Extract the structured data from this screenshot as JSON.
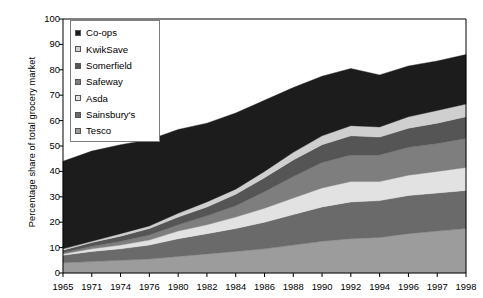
{
  "chart_data": {
    "type": "area",
    "stacked": true,
    "title": "",
    "xlabel": "",
    "ylabel": "Percentage share of total grocery market",
    "ylim": [
      0,
      100
    ],
    "ytick_labels": [
      "0",
      "10",
      "20",
      "30",
      "40",
      "50",
      "60",
      "70",
      "80",
      "90",
      "100"
    ],
    "grid": false,
    "legend_position": "top-left",
    "categories": [
      "1965",
      "1971",
      "1974",
      "1976",
      "1980",
      "1982",
      "1984",
      "1986",
      "1988",
      "1990",
      "1992",
      "1994",
      "1996",
      "1997",
      "1998"
    ],
    "x": [
      1965,
      1971,
      1974,
      1976,
      1980,
      1982,
      1984,
      1986,
      1988,
      1990,
      1992,
      1994,
      1996,
      1997,
      1998
    ],
    "series": [
      {
        "name": "Tesco",
        "color": "#9c9c9c",
        "values": [
          4.0,
          4.5,
          5.0,
          5.5,
          6.5,
          7.5,
          8.5,
          9.5,
          11.0,
          12.5,
          13.5,
          14.0,
          15.5,
          16.5,
          17.5
        ]
      },
      {
        "name": "Sainsbury's",
        "color": "#6a6a6a",
        "values": [
          3.0,
          4.0,
          4.5,
          5.5,
          7.0,
          8.0,
          9.0,
          10.5,
          12.0,
          13.5,
          14.5,
          14.5,
          15.0,
          15.0,
          15.0
        ]
      },
      {
        "name": "Asda",
        "color": "#e2e2e2",
        "values": [
          0.5,
          1.0,
          1.5,
          2.0,
          3.0,
          3.5,
          4.5,
          5.5,
          6.5,
          7.5,
          8.0,
          7.5,
          8.0,
          8.5,
          9.0
        ]
      },
      {
        "name": "Safeway",
        "color": "#7e7e7e",
        "values": [
          0.5,
          1.0,
          1.5,
          2.0,
          2.5,
          3.5,
          4.5,
          6.5,
          8.5,
          10.0,
          10.5,
          10.5,
          11.0,
          11.0,
          11.5
        ]
      },
      {
        "name": "Somerfield",
        "color": "#555555",
        "values": [
          1.0,
          1.5,
          2.0,
          2.5,
          3.0,
          3.5,
          4.5,
          5.5,
          6.5,
          7.0,
          7.5,
          7.0,
          7.5,
          8.0,
          8.5
        ]
      },
      {
        "name": "KwikSave",
        "color": "#cfcfcf",
        "values": [
          0.5,
          0.5,
          1.0,
          1.0,
          1.5,
          2.0,
          2.0,
          2.5,
          3.0,
          3.5,
          4.0,
          4.0,
          4.5,
          5.0,
          5.0
        ]
      },
      {
        "name": "Co-ops",
        "color": "#1c1c1c",
        "values": [
          34.5,
          35.5,
          35.0,
          34.0,
          33.0,
          31.0,
          30.0,
          28.0,
          25.5,
          23.5,
          22.5,
          20.5,
          20.0,
          19.5,
          19.5
        ]
      }
    ],
    "totals": [
      44.0,
      48.0,
      50.5,
      52.5,
      56.5,
      59.0,
      63.0,
      68.0,
      73.0,
      77.5,
      80.5,
      78.0,
      81.5,
      83.5,
      86.0
    ]
  },
  "legend": {
    "items": [
      {
        "label": "Co-ops",
        "color": "#1c1c1c"
      },
      {
        "label": "KwikSave",
        "color": "#cfcfcf"
      },
      {
        "label": "Somerfield",
        "color": "#555555"
      },
      {
        "label": "Safeway",
        "color": "#7e7e7e"
      },
      {
        "label": "Asda",
        "color": "#e2e2e2"
      },
      {
        "label": "Sainsbury's",
        "color": "#6a6a6a"
      },
      {
        "label": "Tesco",
        "color": "#9c9c9c"
      }
    ]
  },
  "axis": {
    "y_label": "Percentage share of total grocery market",
    "y_ticks": [
      "100",
      "90",
      "80",
      "70",
      "60",
      "50",
      "40",
      "30",
      "20",
      "10",
      "0"
    ],
    "x_ticks": [
      "1965",
      "1971",
      "1974",
      "1976",
      "1980",
      "1982",
      "1984",
      "1986",
      "1988",
      "1990",
      "1992",
      "1994",
      "1996",
      "1997",
      "1998"
    ]
  }
}
